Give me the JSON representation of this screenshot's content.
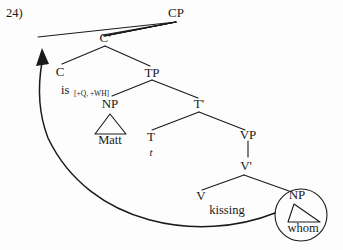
{
  "figure": {
    "example_number": "24)",
    "type": "syntax-tree"
  },
  "nodes": {
    "cp": "CP",
    "cbar": "C'",
    "c": "C",
    "tp": "TP",
    "np_subject": "NP",
    "tbar": "T'",
    "t": "T",
    "vp": "VP",
    "vbar": "V'",
    "v": "V",
    "np_object": "NP"
  },
  "terminals": {
    "c_head": "is",
    "c_features": "[+Q, +WH]",
    "subject": "Matt",
    "trace": "t",
    "verb": "kissing",
    "object": "whom"
  },
  "annotations": {
    "movement_arrow": "wh-movement",
    "circled_constituent": "whom",
    "empty_specifier": "Spec,CP"
  },
  "colors": {
    "ink": "#1a1a1a",
    "background": "#fdfdfd"
  }
}
